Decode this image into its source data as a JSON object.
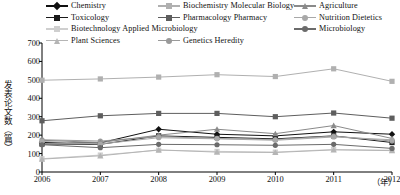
{
  "chart_data": {
    "type": "line",
    "title": "",
    "xlabel": "年",
    "ylabel": "发表论文数（篇）",
    "x": [
      2006,
      2007,
      2008,
      2009,
      2010,
      2011,
      2012
    ],
    "categories": [
      "2006",
      "2007",
      "2008",
      "2009",
      "2010",
      "2011",
      "2012"
    ],
    "xtick_labels": [
      "2006",
      "2007",
      "2008",
      "2009",
      "2010",
      "2011",
      "2012"
    ],
    "ytick_labels": [
      "0",
      "100",
      "200",
      "300",
      "400",
      "500",
      "600",
      "700"
    ],
    "yticks": [
      0,
      100,
      200,
      300,
      400,
      500,
      600,
      700
    ],
    "ylim": [
      0,
      700
    ],
    "xlim": [
      2006,
      2012
    ],
    "grid": false,
    "legend_position": "top",
    "series": [
      {
        "name": "Chemistry",
        "marker": "diamond",
        "color": "#111111",
        "values": [
          160,
          158,
          232,
          205,
          196,
          218,
          205
        ]
      },
      {
        "name": "Toxicology",
        "marker": "square",
        "color": "#1a1a1a",
        "values": [
          152,
          150,
          196,
          188,
          180,
          196,
          160
        ]
      },
      {
        "name": "Biotechnology Applied Microbiology",
        "marker": "square",
        "color": "#cfcfcf",
        "values": [
          72,
          92,
          118,
          112,
          108,
          122,
          118
        ]
      },
      {
        "name": "Plant Sciences",
        "marker": "triangle",
        "color": "#b5b5b5",
        "values": [
          70,
          88,
          120,
          108,
          106,
          120,
          116
        ]
      },
      {
        "name": "Biochemistry Molecular Biology",
        "marker": "square",
        "color": "#b0b0b0",
        "values": [
          498,
          505,
          515,
          528,
          518,
          560,
          492
        ]
      },
      {
        "name": "Pharmacology Pharmacy",
        "marker": "square",
        "color": "#5e5e5e",
        "values": [
          278,
          305,
          318,
          318,
          300,
          320,
          292
        ]
      },
      {
        "name": "Genetics Heredity",
        "marker": "circle",
        "color": "#9a9a9a",
        "values": [
          175,
          168,
          192,
          182,
          176,
          195,
          168
        ]
      },
      {
        "name": "Agriculture",
        "marker": "triangle",
        "color": "#8a8a8a",
        "values": [
          172,
          160,
          200,
          232,
          208,
          252,
          182
        ]
      },
      {
        "name": "Nutrition Dietetics",
        "marker": "circle",
        "color": "#a8a8a8",
        "values": [
          166,
          152,
          186,
          180,
          172,
          190,
          175
        ]
      },
      {
        "name": "Microbiology",
        "marker": "circle",
        "color": "#6b6b6b",
        "values": [
          148,
          132,
          150,
          148,
          145,
          150,
          128
        ]
      }
    ]
  },
  "legend": {
    "rows": [
      [
        {
          "label": "Chemistry",
          "marker": "diamond",
          "color": "#111111"
        },
        {
          "label": "Biochemistry Molecular Biology",
          "marker": "square",
          "color": "#b0b0b0"
        },
        {
          "label": "Agriculture",
          "marker": "triangle",
          "color": "#8a8a8a"
        }
      ],
      [
        {
          "label": "Toxicology",
          "marker": "square",
          "color": "#1a1a1a"
        },
        {
          "label": "Pharmacology Pharmacy",
          "marker": "square",
          "color": "#5e5e5e"
        },
        {
          "label": "Nutrition Dietetics",
          "marker": "circle",
          "color": "#a8a8a8"
        }
      ],
      [
        {
          "label": "Biotechnology Applied Microbiology",
          "marker": "square",
          "color": "#cfcfcf"
        },
        {
          "label": "Microbiology",
          "marker": "circle",
          "color": "#6b6b6b"
        }
      ],
      [
        {
          "label": "Plant Sciences",
          "marker": "triangle",
          "color": "#b5b5b5"
        },
        {
          "label": "Genetics Heredity",
          "marker": "circle",
          "color": "#9a9a9a"
        }
      ]
    ]
  },
  "axes": {
    "y_title": "发表论文数（篇）",
    "x_unit": "（年）",
    "axis_color": "#000000"
  }
}
